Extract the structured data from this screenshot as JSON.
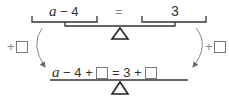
{
  "top_equation": {
    "left": {
      "var": "a",
      "rest": " − 4"
    },
    "equals": "=",
    "right": "3"
  },
  "left_operation": {
    "plus": "+"
  },
  "right_operation": {
    "plus": "+"
  },
  "bottom_equation": {
    "var": "a",
    "part1": " − 4 + ",
    "part2": " = 3 + "
  },
  "colors": {
    "line": "#333333",
    "arrow": "#888888",
    "box_border": "#777777"
  }
}
